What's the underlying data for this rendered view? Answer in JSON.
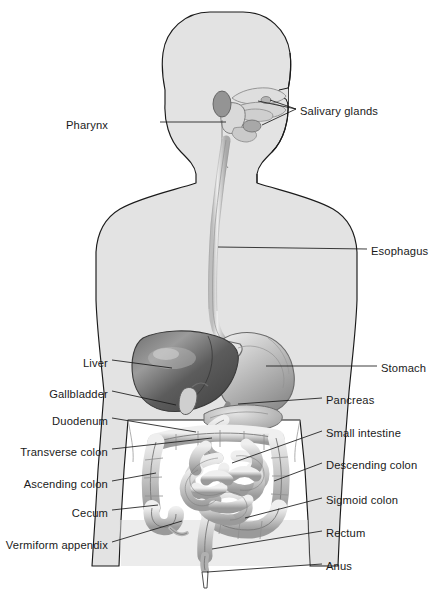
{
  "diagram": {
    "orientation": "anterior view with head in right-facing profile",
    "background_color": "#ffffff",
    "body_fill_color": "#e3e3e3",
    "body_outline_color": "#1a1a1a",
    "organ_dark_color": "#5f5f5f",
    "organ_light_color": "#d8d8d8",
    "label_color": "#1a1a1a",
    "leader_line_color": "#1a1a1a"
  },
  "labels": {
    "left": [
      {
        "id": "pharynx",
        "text": "Pharynx",
        "x": 155,
        "y": 125,
        "line_to_x": 226,
        "line_to_y": 122
      },
      {
        "id": "liver",
        "text": "Liver",
        "x": 108,
        "y": 363,
        "line_to_x": 172,
        "line_to_y": 368
      },
      {
        "id": "gallbladder",
        "text": "Gallbladder",
        "x": 108,
        "y": 394,
        "line_to_x": 176,
        "line_to_y": 405
      },
      {
        "id": "duodenum",
        "text": "Duodenum",
        "x": 108,
        "y": 421,
        "line_to_x": 196,
        "line_to_y": 432
      },
      {
        "id": "transverse-colon",
        "text": "Transverse colon",
        "x": 108,
        "y": 452,
        "line_to_x": 212,
        "line_to_y": 438
      },
      {
        "id": "ascending-colon",
        "text": "Ascending colon",
        "x": 108,
        "y": 484,
        "line_to_x": 156,
        "line_to_y": 473
      },
      {
        "id": "cecum",
        "text": "Cecum",
        "x": 108,
        "y": 513,
        "line_to_x": 158,
        "line_to_y": 505
      },
      {
        "id": "vermiform-appendix",
        "text": "Vermiform appendix",
        "x": 108,
        "y": 545,
        "line_to_x": 176,
        "line_to_y": 519
      }
    ],
    "right": [
      {
        "id": "salivary-glands",
        "text": "Salivary glands",
        "x": 300,
        "y": 112,
        "line_to_x": 258,
        "line_to_y": 104
      },
      {
        "id": "esophagus",
        "text": "Esophagus",
        "x": 371,
        "y": 252,
        "line_to_x": 220,
        "line_to_y": 247
      },
      {
        "id": "stomach",
        "text": "Stomach",
        "x": 381,
        "y": 369,
        "line_to_x": 268,
        "line_to_y": 366
      },
      {
        "id": "pancreas",
        "text": "Pancreas",
        "x": 326,
        "y": 401,
        "line_to_x": 235,
        "line_to_y": 404
      },
      {
        "id": "small-intestine",
        "text": "Small intestine",
        "x": 326,
        "y": 434,
        "line_to_x": 232,
        "line_to_y": 463
      },
      {
        "id": "descending-colon",
        "text": "Descending colon",
        "x": 326,
        "y": 466,
        "line_to_x": 272,
        "line_to_y": 481
      },
      {
        "id": "sigmoid-colon",
        "text": "Sigmoid colon",
        "x": 326,
        "y": 501,
        "line_to_x": 243,
        "line_to_y": 518
      },
      {
        "id": "rectum",
        "text": "Rectum",
        "x": 326,
        "y": 534,
        "line_to_x": 212,
        "line_to_y": 549
      },
      {
        "id": "anus",
        "text": "Anus",
        "x": 326,
        "y": 567,
        "line_to_x": 207,
        "line_to_y": 572
      }
    ]
  }
}
